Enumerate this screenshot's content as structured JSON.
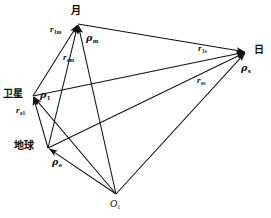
{
  "figure": {
    "background_color": "#ffffff",
    "line_color": "#111111",
    "width": 271,
    "height": 218
  },
  "nodes": [
    {
      "id": "moon",
      "label": "月",
      "x": 78,
      "y": 24,
      "label_x": 71,
      "label_y": 6
    },
    {
      "id": "sun",
      "label": "日",
      "x": 246,
      "y": 52,
      "label_x": 254,
      "label_y": 45
    },
    {
      "id": "satellite",
      "label": "卫星",
      "x": 33,
      "y": 96,
      "label_x": 3,
      "label_y": 89
    },
    {
      "id": "earth",
      "label": "地球",
      "x": 48,
      "y": 148,
      "label_x": 14,
      "label_y": 141
    },
    {
      "id": "origin",
      "label": "O",
      "sub": "1",
      "x": 116,
      "y": 194,
      "label_x": 110,
      "label_y": 199
    }
  ],
  "vectors": [
    {
      "id": "rho-m",
      "symbol": "ρ",
      "sub": "m",
      "from": "origin",
      "to": "moon",
      "label_x": 86,
      "label_y": 33
    },
    {
      "id": "rho-s",
      "symbol": "ρ",
      "sub": "s",
      "from": "origin",
      "to": "sun",
      "label_x": 241,
      "label_y": 63
    },
    {
      "id": "rho-1",
      "symbol": "ρ",
      "sub": "1",
      "from": "origin",
      "to": "satellite",
      "label_x": 40,
      "label_y": 90
    },
    {
      "id": "rho-e",
      "symbol": "ρ",
      "sub": "e",
      "from": "origin",
      "to": "earth",
      "label_x": 52,
      "label_y": 157
    },
    {
      "id": "r-1m",
      "symbol": "r",
      "sub": "1m",
      "from": "satellite",
      "to": "moon",
      "label_x": 50,
      "label_y": 25
    },
    {
      "id": "r-em",
      "symbol": "r",
      "sub": "em",
      "from": "earth",
      "to": "moon",
      "label_x": 63,
      "label_y": 53
    },
    {
      "id": "r-1s",
      "symbol": "r",
      "sub": "1s",
      "from": "satellite",
      "to": "sun",
      "label_x": 198,
      "label_y": 44
    },
    {
      "id": "r-es",
      "symbol": "r",
      "sub": "es",
      "from": "earth",
      "to": "sun",
      "label_x": 197,
      "label_y": 76
    },
    {
      "id": "r-e1",
      "symbol": "r",
      "sub": "e1",
      "from": "earth",
      "to": "satellite",
      "label_x": 16,
      "label_y": 106
    }
  ],
  "edges": [
    {
      "id": "edge-moon-sun",
      "from": "moon",
      "to": "sun"
    },
    {
      "id": "edge-satellite-sun",
      "from": "satellite",
      "to": "sun"
    },
    {
      "id": "edge-earth-sun",
      "from": "earth",
      "to": "sun"
    },
    {
      "id": "edge-satellite-moon",
      "from": "satellite",
      "to": "moon"
    },
    {
      "id": "edge-earth-moon",
      "from": "earth",
      "to": "moon"
    },
    {
      "id": "edge-earth-satellite",
      "from": "earth",
      "to": "satellite"
    },
    {
      "id": "edge-origin-moon",
      "from": "origin",
      "to": "moon"
    },
    {
      "id": "edge-origin-sun",
      "from": "origin",
      "to": "sun"
    },
    {
      "id": "edge-origin-satellite",
      "from": "origin",
      "to": "satellite"
    },
    {
      "id": "edge-origin-earth",
      "from": "origin",
      "to": "earth"
    }
  ]
}
